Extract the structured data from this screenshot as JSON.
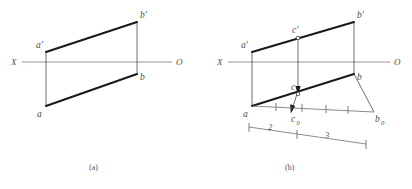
{
  "figure": {
    "type": "descriptive-geometry-orthographic-projection",
    "caption_a": "(a)",
    "caption_b": "(b)",
    "footer_note": ""
  },
  "panel_a": {
    "name": "(a)",
    "axis": {
      "left_label": "X",
      "right_label": "O"
    },
    "points": [
      {
        "id": "a-prime",
        "label": "a'",
        "x": 46,
        "y": 52
      },
      {
        "id": "b-prime",
        "label": "b'",
        "x": 137,
        "y": 22
      },
      {
        "id": "b",
        "label": "b",
        "x": 137,
        "y": 74
      },
      {
        "id": "a",
        "label": "a",
        "x": 46,
        "y": 106
      }
    ]
  },
  "panel_b": {
    "name": "(b)",
    "axis": {
      "left_label": "X",
      "right_label": "O"
    },
    "points": [
      {
        "id": "a-prime",
        "label": "a'",
        "x": 252,
        "y": 52
      },
      {
        "id": "b-prime",
        "label": "b'",
        "x": 354,
        "y": 22
      },
      {
        "id": "c-prime",
        "label": "c'",
        "x": 298,
        "y": 38
      },
      {
        "id": "b",
        "label": "b",
        "x": 354,
        "y": 74
      },
      {
        "id": "c",
        "label": "c",
        "x": 298,
        "y": 94
      },
      {
        "id": "a",
        "label": "a",
        "x": 252,
        "y": 106
      },
      {
        "id": "c-zero",
        "label": "c",
        "sub": "0",
        "x": 300,
        "y": 110
      },
      {
        "id": "b-zero",
        "label": "b",
        "sub": "0",
        "x": 378,
        "y": 113
      }
    ],
    "dimensions": [
      {
        "id": "seg-2",
        "label": "2"
      },
      {
        "id": "seg-3",
        "label": "3"
      }
    ]
  }
}
